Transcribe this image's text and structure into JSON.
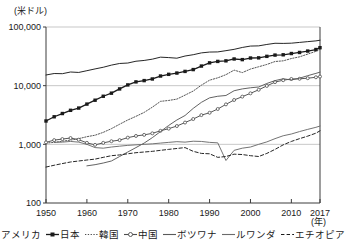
{
  "chart_data": {
    "type": "line",
    "title": "",
    "subtitle": "",
    "xlabel": "(年)",
    "ylabel": "(米ドル)",
    "yscale": "log",
    "ylim": [
      100,
      100000
    ],
    "xlim": [
      1950,
      2017
    ],
    "grid": true,
    "legend_position": "bottom",
    "ytick_labels": [
      "100,000",
      "10,000",
      "1,000",
      "100"
    ],
    "ytick_values": [
      100000,
      10000,
      1000,
      100
    ],
    "xtick_labels": [
      "1950",
      "1960",
      "1970",
      "1980",
      "1990",
      "2000",
      "2010",
      "2017"
    ],
    "xtick_values": [
      1950,
      1960,
      1970,
      1980,
      1990,
      2000,
      2010,
      2017
    ],
    "x": [
      1950,
      1952,
      1954,
      1956,
      1958,
      1960,
      1962,
      1964,
      1966,
      1968,
      1970,
      1972,
      1974,
      1976,
      1978,
      1980,
      1982,
      1984,
      1986,
      1988,
      1990,
      1992,
      1994,
      1996,
      1998,
      2000,
      2002,
      2004,
      2006,
      2008,
      2010,
      2012,
      2014,
      2016,
      2017
    ],
    "series": [
      {
        "name": "アメリカ",
        "style": "solid",
        "marker": "none",
        "color": "#1a1a1a",
        "values": [
          15200,
          16100,
          16000,
          17100,
          16800,
          18000,
          19300,
          20600,
          22400,
          23900,
          24300,
          26100,
          26900,
          28300,
          30600,
          30100,
          29400,
          32000,
          33700,
          36200,
          37400,
          37600,
          39500,
          41600,
          44800,
          47300,
          47700,
          50400,
          52800,
          52500,
          53000,
          54600,
          56300,
          58000,
          59500
        ]
      },
      {
        "name": "日本",
        "style": "solid",
        "marker": "filled-square",
        "color": "#1a1a1a",
        "values": [
          2500,
          2950,
          3350,
          3800,
          4150,
          4850,
          5650,
          6600,
          7450,
          8800,
          10300,
          11600,
          12200,
          13000,
          14600,
          15600,
          16400,
          17500,
          18800,
          21600,
          24500,
          25900,
          26500,
          28500,
          27800,
          29600,
          29800,
          31600,
          33200,
          33600,
          35300,
          36800,
          38900,
          41300,
          44400
        ]
      },
      {
        "name": "韓国",
        "style": "dotted",
        "marker": "none",
        "color": "#4d4d4d",
        "values": [
          1050,
          1080,
          1130,
          1180,
          1250,
          1350,
          1430,
          1600,
          1850,
          2200,
          2600,
          3000,
          3500,
          4300,
          5400,
          5600,
          5900,
          6900,
          8100,
          10200,
          12400,
          13600,
          15400,
          18400,
          16700,
          19200,
          21000,
          23000,
          25800,
          26500,
          29000,
          31000,
          34500,
          38500,
          41500
        ]
      },
      {
        "name": "中国",
        "style": "solid",
        "marker": "open-circle",
        "color": "#4d4d4d",
        "values": [
          1080,
          1180,
          1230,
          1280,
          1200,
          1060,
          980,
          1060,
          1130,
          1180,
          1300,
          1390,
          1450,
          1540,
          1700,
          1850,
          2050,
          2350,
          2700,
          3150,
          3450,
          4000,
          4800,
          5700,
          6500,
          7400,
          8500,
          9900,
          11500,
          12400,
          13000,
          13100,
          13400,
          13900,
          14300
        ]
      },
      {
        "name": "ボツワナ",
        "style": "solid",
        "marker": "none",
        "color": "#5a5a5a",
        "values": [
          null,
          null,
          null,
          null,
          null,
          430,
          450,
          480,
          520,
          620,
          740,
          880,
          1050,
          1300,
          1650,
          2100,
          2600,
          3100,
          4100,
          5200,
          6200,
          6600,
          6800,
          8200,
          8800,
          9200,
          9500,
          10900,
          12200,
          13100,
          12500,
          13400,
          14800,
          16200,
          17000
        ]
      },
      {
        "name": "ルワンダ",
        "style": "solid",
        "marker": "none",
        "color": "#6b6b6b",
        "values": [
          null,
          1080,
          1090,
          1120,
          1090,
          1000,
          880,
          860,
          900,
          930,
          960,
          980,
          1000,
          1020,
          1050,
          1080,
          1110,
          1090,
          1130,
          1120,
          1080,
          1060,
          530,
          790,
          860,
          900,
          1000,
          1100,
          1250,
          1400,
          1500,
          1650,
          1800,
          1950,
          2050
        ]
      },
      {
        "name": "エチオピア",
        "style": "dashed",
        "marker": "none",
        "color": "#1a1a1a",
        "values": [
          410,
          440,
          470,
          500,
          520,
          540,
          560,
          600,
          640,
          660,
          690,
          720,
          740,
          760,
          790,
          820,
          850,
          880,
          760,
          700,
          690,
          600,
          620,
          680,
          670,
          640,
          620,
          700,
          820,
          980,
          1120,
          1250,
          1380,
          1550,
          1700
        ]
      }
    ],
    "annotations": []
  }
}
